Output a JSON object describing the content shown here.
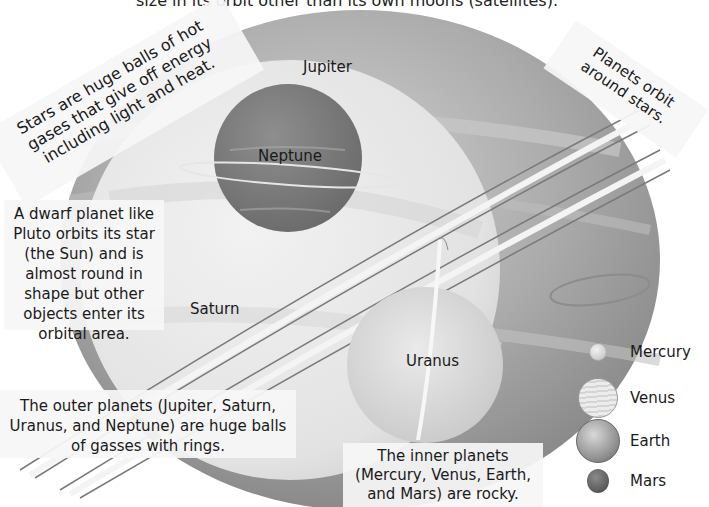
{
  "header": {
    "caption_partial": "size in its orbit other than its own moons (satellites)."
  },
  "notes": {
    "stars": "Stars are huge balls of hot gases that give off energy including light and heat.",
    "planets_orbit": "Planets orbit around stars.",
    "dwarf_planet": "A dwarf planet like Pluto orbits its star (the Sun) and is almost round in shape but other objects enter its orbital area.",
    "outer_planets": "The outer planets (Jupiter, Saturn, Uranus, and Neptune) are huge balls of gasses with rings.",
    "inner_planets": "The inner planets (Mercury, Venus, Earth, and Mars) are rocky."
  },
  "planet_labels": {
    "jupiter": "Jupiter",
    "neptune": "Neptune",
    "saturn": "Saturn",
    "uranus": "Uranus"
  },
  "legend": {
    "items": [
      {
        "label": "Mercury",
        "size": 18,
        "color": "#d8d8d8"
      },
      {
        "label": "Venus",
        "size": 38,
        "color": "#e6e6e6"
      },
      {
        "label": "Earth",
        "size": 44,
        "color": "#9a9a9a"
      },
      {
        "label": "Mars",
        "size": 24,
        "color": "#5e5e5e"
      }
    ]
  },
  "colors": {
    "jupiter": "#a9a9a9",
    "saturn": "#e4e4e4",
    "neptune": "#7a7a7a",
    "uranus": "#d9d9d9",
    "note_bg": "#f6f6f6"
  }
}
